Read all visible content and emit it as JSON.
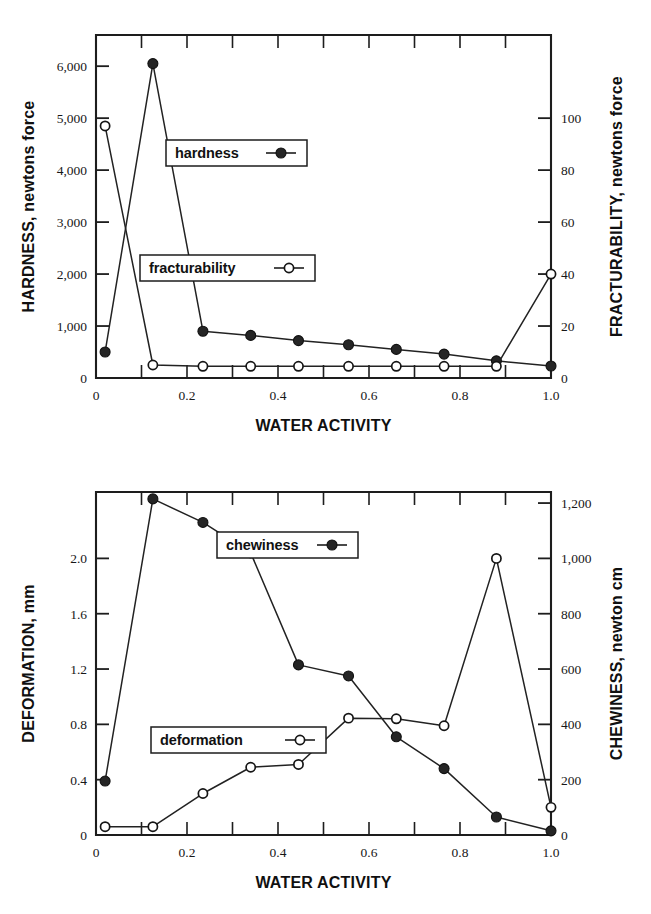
{
  "figure": {
    "background": "#ffffff",
    "ink": "#1d1d1d"
  },
  "chart_data": [
    {
      "id": "top",
      "type": "line",
      "title": "",
      "xlabel": "WATER ACTIVITY",
      "ylabel": "HARDNESS, newtons force",
      "y2label": "FRACTURABILITY, newtons force",
      "grid": false,
      "legend_position": "inside",
      "xlim": [
        0,
        1.0
      ],
      "xticks": [
        0,
        0.2,
        0.4,
        0.6,
        0.8,
        1.0
      ],
      "xticklabels": [
        "0",
        "0.2",
        "0.4",
        "0.6",
        "0.8",
        "1.0"
      ],
      "xminor_step": 0.1,
      "ylim": [
        0,
        6600
      ],
      "yticks": [
        0,
        1000,
        2000,
        3000,
        4000,
        5000,
        6000
      ],
      "yticklabels": [
        "0",
        "1,000",
        "2,000",
        "3,000",
        "4,000",
        "5,000",
        "6,000"
      ],
      "y2lim": [
        0,
        132
      ],
      "y2ticks": [
        0,
        20,
        40,
        60,
        80,
        100
      ],
      "y2ticklabels": [
        "0",
        "20",
        "40",
        "60",
        "80",
        "100"
      ],
      "x": [
        0.02,
        0.125,
        0.235,
        0.34,
        0.445,
        0.555,
        0.66,
        0.765,
        0.88,
        1.0
      ],
      "series": [
        {
          "name": "hardness",
          "axis": "left",
          "marker": "filled-circle",
          "values": [
            500,
            6050,
            900,
            820,
            720,
            640,
            550,
            460,
            330,
            230
          ]
        },
        {
          "name": "fracturability",
          "axis": "right",
          "marker": "open-circle",
          "values": [
            97,
            5,
            4.5,
            4.5,
            4.5,
            4.5,
            4.5,
            4.5,
            4.5,
            40
          ]
        }
      ]
    },
    {
      "id": "bottom",
      "type": "line",
      "title": "",
      "xlabel": "WATER ACTIVITY",
      "ylabel": "DEFORMATION, mm",
      "y2label": "CHEWINESS, newton cm",
      "grid": false,
      "legend_position": "inside",
      "xlim": [
        0,
        1.0
      ],
      "xticks": [
        0,
        0.2,
        0.4,
        0.6,
        0.8,
        1.0
      ],
      "xticklabels": [
        "0",
        "0.2",
        "0.4",
        "0.6",
        "0.8",
        "1.0"
      ],
      "xminor_step": 0.1,
      "ylim": [
        0,
        2.48
      ],
      "yticks": [
        0,
        0.4,
        0.8,
        1.2,
        1.6,
        2.0
      ],
      "yticklabels": [
        "0",
        "0.4",
        "0.8",
        "1.2",
        "1.6",
        "2.0"
      ],
      "y2lim": [
        0,
        1240
      ],
      "y2ticks": [
        0,
        200,
        400,
        600,
        800,
        1000,
        1200
      ],
      "y2ticklabels": [
        "0",
        "200",
        "400",
        "600",
        "800",
        "1,000",
        "1,200"
      ],
      "x": [
        0.02,
        0.125,
        0.235,
        0.34,
        0.445,
        0.555,
        0.66,
        0.765,
        0.88,
        1.0
      ],
      "series": [
        {
          "name": "chewiness",
          "axis": "right",
          "marker": "filled-circle",
          "values": [
            195,
            1215,
            1130,
            1020,
            615,
            575,
            355,
            240,
            65,
            15
          ]
        },
        {
          "name": "deformation",
          "axis": "left",
          "marker": "open-circle",
          "values": [
            0.06,
            0.06,
            0.3,
            0.49,
            0.51,
            0.845,
            0.84,
            0.79,
            2.0,
            0.2
          ]
        }
      ]
    }
  ],
  "top_chart": {
    "y_axis_title": "HARDNESS, newtons force",
    "y2_axis_title": "FRACTURABILITY, newtons force",
    "x_axis_title": "WATER ACTIVITY",
    "legend": [
      {
        "label": "hardness",
        "marker": "filled-circle"
      },
      {
        "label": "fracturability",
        "marker": "open-circle"
      }
    ]
  },
  "bottom_chart": {
    "y_axis_title": "DEFORMATION, mm",
    "y2_axis_title": "CHEWINESS, newton cm",
    "x_axis_title": "WATER ACTIVITY",
    "legend": [
      {
        "label": "chewiness",
        "marker": "filled-circle"
      },
      {
        "label": "deformation",
        "marker": "open-circle"
      }
    ]
  }
}
